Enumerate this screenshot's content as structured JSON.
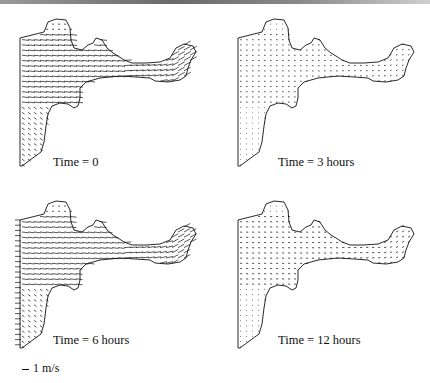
{
  "figure": {
    "type": "velocity-vector-field-panels",
    "panels": [
      {
        "id": "t0",
        "caption": "Time = 0",
        "vector_length": 7.0,
        "left_boundary_ticks": false
      },
      {
        "id": "t3",
        "caption": "Time = 3 hours",
        "vector_length": 1.6,
        "left_boundary_ticks": false
      },
      {
        "id": "t6",
        "caption": "Time = 6 hours",
        "vector_length": 6.5,
        "left_boundary_ticks": true
      },
      {
        "id": "t12",
        "caption": "Time = 12 hours",
        "vector_length": 2.2,
        "left_boundary_ticks": false
      }
    ],
    "scale_legend": {
      "label": "1 m/s"
    }
  },
  "colors": {
    "ink": "#111111",
    "background": "#ffffff"
  }
}
